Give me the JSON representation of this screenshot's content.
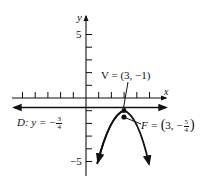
{
  "diagram": {
    "type": "parabola-graph",
    "axes": {
      "x_label": "x",
      "y_label": "y",
      "y_tick_labels": {
        "top": "5",
        "bottom": "−5"
      }
    },
    "vertex": {
      "label": "V = (3, −1)",
      "x": 3,
      "y": -1
    },
    "focus": {
      "label_prefix": "F = ",
      "x": "3",
      "y_num": "5",
      "y_den": "4",
      "y_sign": "−"
    },
    "directrix": {
      "label_prefix": "D: y = ",
      "num": "3",
      "den": "4",
      "sign": "−"
    },
    "equation_hint": "(x − 3)^2 = −(y + 1)",
    "colors": {
      "ink": "#111111",
      "background": "#ffffff"
    }
  }
}
